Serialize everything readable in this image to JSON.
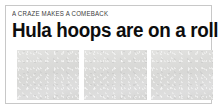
{
  "teaser": {
    "kicker": "A CRAZE MAKES A COMEBACK",
    "headline": "Hula hoops are on a roll",
    "photos": [
      {
        "name": "photo-placeholder-1",
        "alt": ""
      },
      {
        "name": "photo-placeholder-2",
        "alt": ""
      },
      {
        "name": "photo-placeholder-3",
        "alt": ""
      }
    ]
  },
  "colors": {
    "background": "#ffffff",
    "frame_border": "#c8c8c8",
    "kicker_text": "#3a3a3a",
    "headline_text": "#0d0d0d",
    "photo_placeholder": "#dddddd"
  }
}
